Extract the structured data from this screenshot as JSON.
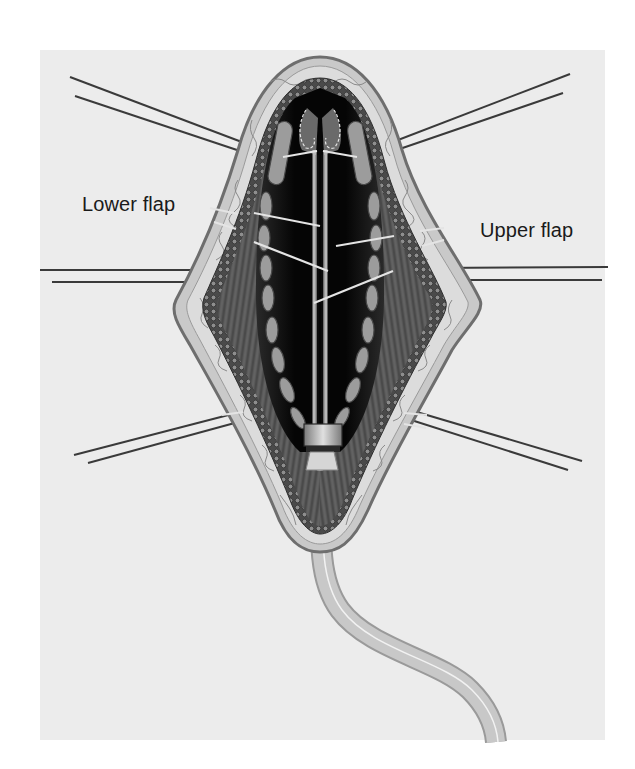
{
  "figure": {
    "type": "surgical-illustration",
    "colors": {
      "page_background": "#ffffff",
      "panel_background": "#ececec",
      "skin_outer": "#8a8a8a",
      "subcutaneous": "#d6d6d6",
      "muscle": "#5a5a5a",
      "cavity": "#0d0d0d",
      "cartilage": "#9c9c9c",
      "tube": "#c4c4c4",
      "retractor_line": "#3a3a3a",
      "suture": "#e2e2e2"
    },
    "labels": {
      "lower_flap": "Lower flap",
      "upper_flap": "Upper flap"
    },
    "retractors": [
      {
        "side": "left",
        "position": "top"
      },
      {
        "side": "right",
        "position": "top"
      },
      {
        "side": "left",
        "position": "middle"
      },
      {
        "side": "right",
        "position": "middle"
      },
      {
        "side": "left",
        "position": "bottom"
      },
      {
        "side": "right",
        "position": "bottom"
      }
    ],
    "elements": [
      "skin-flap-outline",
      "subcutaneous-layer",
      "muscle-layer",
      "cartilage-segments",
      "central-rod",
      "sutures",
      "connector",
      "drain-tube"
    ]
  }
}
